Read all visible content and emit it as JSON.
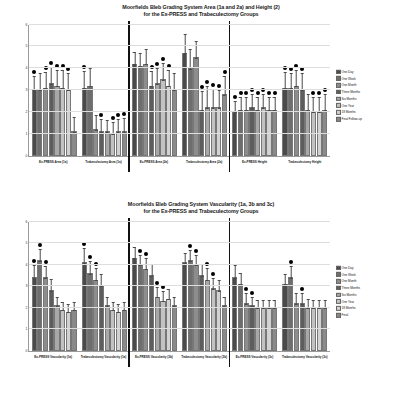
{
  "charts": [
    {
      "id": "top",
      "title_line1": "Moorfields Bleb Grading System Area (1a and 2a) and Height (2)",
      "title_line2": "for the Ex-PRESS and Trabeculectomy Groups",
      "ylabel": "Moorfields Bleb Grading System Score",
      "chart_data": {
        "type": "bar",
        "title": "Moorfields Bleb Grading System Area (1a and 2a) and Height (2) for the Ex-PRESS and Trabeculectomy Groups",
        "xlabel": "",
        "ylabel": "Moorfields Bleb Grading System Score",
        "ylim": [
          0,
          6
        ],
        "yticks": [
          0,
          1,
          2,
          3,
          4,
          5,
          6
        ],
        "grid": true,
        "legend_position": "right",
        "categories": [
          "Ex-PRESS Area (1a)",
          "Trabeculectomy Area (1a)",
          "Ex-PRESS Area (2a)",
          "Trabeculectomy Area (2a)",
          "Ex-PRESS Height",
          "Trabeculectomy Height"
        ],
        "series": [
          {
            "name": "One Day",
            "values": [
              3.0,
              3.1,
              4.2,
              4.7,
              2.0,
              3.1
            ]
          },
          {
            "name": "One Week",
            "values": [
              3.0,
              3.2,
              4.1,
              4.0,
              2.1,
              3.1
            ]
          },
          {
            "name": "One Month",
            "values": [
              3.1,
              1.2,
              4.2,
              4.5,
              2.1,
              3.2
            ]
          },
          {
            "name": "Three Months",
            "values": [
              3.3,
              1.1,
              3.2,
              2.1,
              2.2,
              3.0
            ]
          },
          {
            "name": "Six Months",
            "values": [
              3.2,
              1.1,
              3.3,
              2.2,
              2.1,
              2.1
            ]
          },
          {
            "name": "One Year",
            "values": [
              3.1,
              1.0,
              3.5,
              2.2,
              2.2,
              2.0
            ]
          },
          {
            "name": "18 Months",
            "values": [
              3.0,
              1.1,
              3.2,
              2.2,
              2.1,
              2.0
            ]
          },
          {
            "name": "Final Follow-up",
            "values": [
              1.1,
              1.1,
              3.0,
              2.8,
              2.1,
              2.1
            ]
          }
        ],
        "errors": [
          {
            "name": "One Day",
            "values": [
              0.35,
              0.4,
              0.3,
              0.45,
              0.28,
              0.38
            ]
          },
          {
            "name": "One Week",
            "values": [
              0.4,
              0.42,
              0.32,
              0.45,
              0.3,
              0.36
            ]
          },
          {
            "name": "One Month",
            "values": [
              0.38,
              0.35,
              0.35,
              0.4,
              0.3,
              0.38
            ]
          },
          {
            "name": "Three Months",
            "values": [
              0.4,
              0.3,
              0.35,
              0.45,
              0.32,
              0.4
            ]
          },
          {
            "name": "Six Months",
            "values": [
              0.38,
              0.28,
              0.38,
              0.5,
              0.3,
              0.38
            ]
          },
          {
            "name": "One Year",
            "values": [
              0.42,
              0.28,
              0.4,
              0.45,
              0.32,
              0.35
            ]
          },
          {
            "name": "18 Months",
            "values": [
              0.42,
              0.3,
              0.38,
              0.42,
              0.3,
              0.36
            ]
          },
          {
            "name": "Final Follow-up",
            "values": [
              0.35,
              0.32,
              0.42,
              0.45,
              0.32,
              0.38
            ]
          }
        ],
        "significance_markers": [
          {
            "group": 0,
            "series": [
              0,
              2,
              3,
              4,
              5,
              6
            ]
          },
          {
            "group": 1,
            "series": [
              0,
              3,
              5,
              6,
              7
            ]
          },
          {
            "group": 2,
            "series": [
              3,
              4,
              5,
              6
            ]
          },
          {
            "group": 3,
            "series": [
              3,
              4,
              5,
              6,
              7
            ]
          },
          {
            "group": 4,
            "series": [
              0,
              1,
              2,
              3,
              4,
              5,
              6,
              7
            ]
          },
          {
            "group": 5,
            "series": [
              0,
              1,
              2,
              3,
              5,
              6,
              7
            ]
          }
        ]
      }
    },
    {
      "id": "bottom",
      "title_line1": "Moorfields Bleb Grading System Vascularity (1a, 3b and 3c)",
      "title_line2": "for the Ex-PRESS and Trabeculectomy Groups",
      "ylabel": "Moorfields Bleb Grading System Score",
      "chart_data": {
        "type": "bar",
        "title": "Moorfields Bleb Grading System Vascularity (1a, 3b and 3c) for the Ex-PRESS and Trabeculectomy Groups",
        "xlabel": "",
        "ylabel": "Moorfields Bleb Grading System Score",
        "ylim": [
          0,
          6
        ],
        "yticks": [
          0,
          1,
          2,
          3,
          4,
          5,
          6
        ],
        "grid": true,
        "legend_position": "right",
        "categories": [
          "Ex-PRESS Vascularity (1a)",
          "Trabeculectomy Vascularity (1a)",
          "Ex-PRESS Vascularity (3b)",
          "Trabeculectomy Vascularity (3b)",
          "Ex-PRESS Vascularity (3c)",
          "Trabeculectomy Vascularity (3c)"
        ],
        "series": [
          {
            "name": "One Day",
            "values": [
              3.4,
              4.1,
              4.3,
              4.1,
              3.4,
              3.1
            ]
          },
          {
            "name": "One Week",
            "values": [
              4.2,
              3.6,
              4.0,
              4.2,
              3.1,
              3.4
            ]
          },
          {
            "name": "One Month",
            "values": [
              3.4,
              3.3,
              3.8,
              4.0,
              2.2,
              2.2
            ]
          },
          {
            "name": "Three Months",
            "values": [
              2.8,
              3.0,
              3.5,
              3.5,
              2.1,
              2.2
            ]
          },
          {
            "name": "Six Months",
            "values": [
              2.1,
              2.1,
              2.5,
              3.3,
              2.0,
              2.0
            ]
          },
          {
            "name": "One Year",
            "values": [
              1.9,
              1.9,
              2.3,
              2.9,
              2.0,
              2.0
            ]
          },
          {
            "name": "18 Months",
            "values": [
              1.8,
              1.8,
              2.4,
              2.8,
              2.0,
              2.0
            ]
          },
          {
            "name": "Final",
            "values": [
              1.9,
              1.9,
              2.1,
              2.1,
              2.0,
              2.0
            ]
          }
        ],
        "errors": [
          {
            "name": "One Day",
            "values": [
              0.3,
              0.35,
              0.28,
              0.25,
              0.3,
              0.25
            ]
          },
          {
            "name": "One Week",
            "values": [
              0.28,
              0.3,
              0.25,
              0.25,
              0.28,
              0.28
            ]
          },
          {
            "name": "One Month",
            "values": [
              0.28,
              0.28,
              0.28,
              0.25,
              0.25,
              0.25
            ]
          },
          {
            "name": "Three Months",
            "values": [
              0.28,
              0.3,
              0.28,
              0.28,
              0.22,
              0.25
            ]
          },
          {
            "name": "Six Months",
            "values": [
              0.22,
              0.22,
              0.25,
              0.28,
              0.2,
              0.22
            ]
          },
          {
            "name": "One Year",
            "values": [
              0.2,
              0.2,
              0.25,
              0.25,
              0.2,
              0.2
            ]
          },
          {
            "name": "18 Months",
            "values": [
              0.2,
              0.2,
              0.25,
              0.25,
              0.2,
              0.2
            ]
          },
          {
            "name": "Final",
            "values": [
              0.2,
              0.2,
              0.22,
              0.22,
              0.2,
              0.2
            ]
          }
        ],
        "significance_markers": [
          {
            "group": 0,
            "series": [
              0,
              1,
              2
            ]
          },
          {
            "group": 1,
            "series": [
              0,
              1,
              2
            ]
          },
          {
            "group": 2,
            "series": [
              1,
              2,
              4,
              5
            ]
          },
          {
            "group": 3,
            "series": [
              1,
              2,
              4,
              5
            ]
          },
          {
            "group": 4,
            "series": [
              2,
              3
            ]
          },
          {
            "group": 5,
            "series": [
              1,
              3
            ]
          }
        ]
      }
    }
  ],
  "series_colors": [
    "#4a4a4a",
    "#6e6e6e",
    "#8d8d8d",
    "#5d5d5d",
    "#a8a8a8",
    "#c2c2c2",
    "#d2d2d2",
    "#8a8a8a"
  ]
}
